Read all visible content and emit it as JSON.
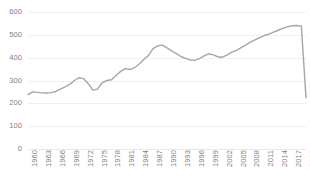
{
  "chart_data": {
    "type": "line",
    "title": "",
    "subtitle": "",
    "xlabel": "",
    "ylabel": "",
    "ylim": [
      0,
      600
    ],
    "xlim": [
      1960,
      2020
    ],
    "ytick_step": 100,
    "yticks": [
      600,
      500,
      400,
      300,
      200,
      100,
      0
    ],
    "xtick_step": 3,
    "xticks": [
      1960,
      1963,
      1966,
      1969,
      1972,
      1975,
      1978,
      1981,
      1984,
      1987,
      1990,
      1993,
      1996,
      1999,
      2002,
      2005,
      2008,
      2011,
      2014,
      2017,
      2020
    ],
    "grid": "horizontal",
    "legend": "none",
    "line_color": "#a6a6a6",
    "line_width": 1.4,
    "markers": "none",
    "x": [
      1960,
      1961,
      1962,
      1963,
      1964,
      1965,
      1966,
      1967,
      1968,
      1969,
      1970,
      1971,
      1972,
      1973,
      1974,
      1975,
      1976,
      1977,
      1978,
      1979,
      1980,
      1981,
      1982,
      1983,
      1984,
      1985,
      1986,
      1987,
      1988,
      1989,
      1990,
      1991,
      1992,
      1993,
      1994,
      1995,
      1996,
      1997,
      1998,
      1999,
      2000,
      2001,
      2002,
      2003,
      2004,
      2005,
      2006,
      2007,
      2008,
      2009,
      2010,
      2011,
      2012,
      2013,
      2014,
      2015,
      2016,
      2017,
      2018,
      2019,
      2020
    ],
    "series": [
      {
        "name": "value",
        "values": [
          238,
          250,
          248,
          246,
          245,
          247,
          252,
          262,
          272,
          283,
          300,
          312,
          308,
          286,
          258,
          262,
          290,
          300,
          303,
          322,
          340,
          352,
          348,
          356,
          372,
          392,
          410,
          440,
          452,
          455,
          443,
          430,
          418,
          405,
          397,
          390,
          388,
          396,
          408,
          417,
          412,
          404,
          402,
          412,
          424,
          432,
          444,
          455,
          468,
          478,
          488,
          497,
          503,
          512,
          520,
          528,
          535,
          540,
          541,
          538,
          225
        ]
      }
    ]
  }
}
